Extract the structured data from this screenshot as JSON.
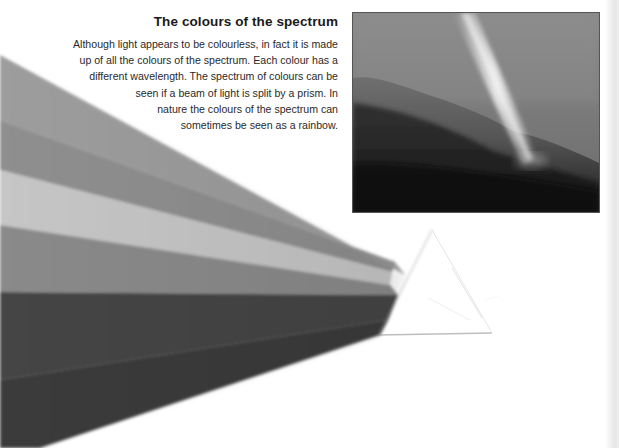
{
  "article": {
    "title": "The colours of the spectrum",
    "body_lines": [
      "Although light appears to be colourless, in fact it is made",
      "up of all the colours of the spectrum. Each colour has a",
      "different wavelength. The spectrum of colours can be",
      "seen if a beam of light is split by a prism. In",
      "nature the colours of the spectrum can",
      "sometimes be seen as a rainbow."
    ]
  },
  "illustrations": {
    "main": {
      "subject": "light-beam-through-prism",
      "icon": "prism-icon"
    },
    "photo": {
      "subject": "light-beam-over-hillside"
    }
  },
  "palette": {
    "text": "#1a1a1a",
    "beam_band_1": "#9a9a9a",
    "beam_band_2": "#8c8c8c",
    "beam_band_3": "#c4c4c4",
    "beam_band_4": "#8a8a8a",
    "beam_band_5": "#444444",
    "beam_band_6": "#3a3a3a"
  }
}
